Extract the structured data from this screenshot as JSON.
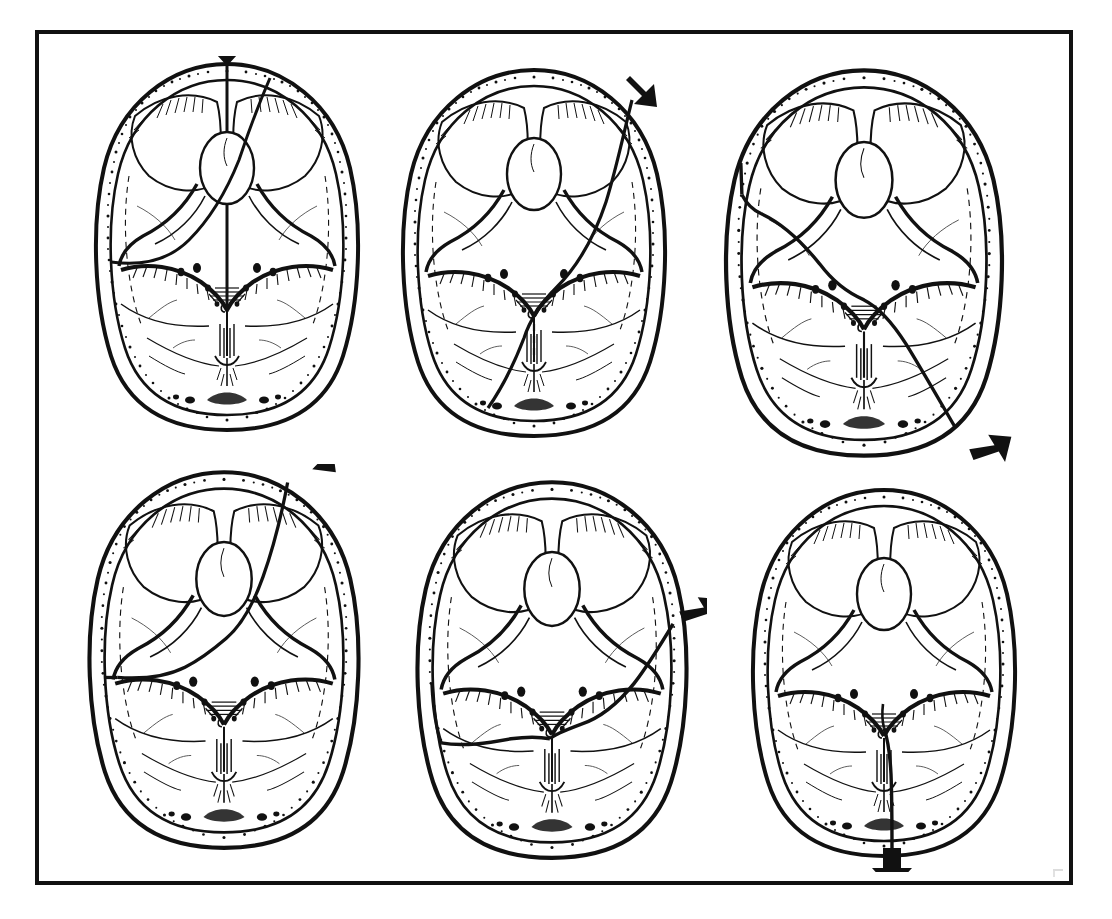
{
  "figure": {
    "domain": "anatomical-line-illustration",
    "frame": {
      "border_color": "#111111",
      "border_width_px": 4,
      "background": "#ffffff",
      "x": 35,
      "y": 30,
      "width": 1038,
      "height": 855
    },
    "ink_color": "#111111",
    "paper_color": "#ffffff",
    "layout": {
      "rows": 2,
      "columns": 3,
      "panel_count": 6
    },
    "view": "superior view of the internal skull base (cranial fossae)",
    "common_structures": [
      "outer table of calvarium",
      "inner table of calvarium",
      "diploe (speckled cancellous bone band)",
      "anterior cranial fossa",
      "cribriform plate",
      "crista galli",
      "lesser wing of sphenoid",
      "greater wing of sphenoid",
      "sella turcica",
      "petrous ridge of temporal bone",
      "middle cranial fossa",
      "posterior cranial fossa",
      "foramen magnum",
      "clivus",
      "internal occipital crest"
    ],
    "panels": [
      {
        "id": "panel-1",
        "label": "A",
        "position": "row 1, column 1",
        "impact_arrows": [
          {
            "name": "arrow-vertex-midline",
            "direction": "down",
            "target": "frontal midline / metopic region",
            "style": "solid block arrow"
          },
          {
            "name": "arrow-right-frontal-oblique",
            "direction": "down-left",
            "target": "right frontal paramedian vault",
            "style": "solid block arrow"
          }
        ],
        "arrow_count": 2,
        "fracture_description": "Midline sagittal fracture running from the frontal vertex posteriorly through the cribriform plate and along the midline to the clivus, with a second oblique limb sweeping from the right frontal region down toward the left petrous/middle fossa."
      },
      {
        "id": "panel-2",
        "label": "B",
        "position": "row 1, column 2",
        "impact_arrows": [
          {
            "name": "arrow-right-frontoparietal",
            "direction": "down-left",
            "target": "right frontoparietal vault",
            "style": "solid block arrow"
          }
        ],
        "arrow_count": 1,
        "fracture_description": "Single long oblique fracture entering at the right frontoparietal vault, crossing the floor of the middle fossa near the sella, and exiting through the left posterior fossa toward the occiput."
      },
      {
        "id": "panel-3",
        "label": "C",
        "position": "row 1, column 3",
        "impact_arrows": [
          {
            "name": "arrow-left-occipital",
            "direction": "up-left",
            "target": "left occipital / asterion region",
            "style": "solid block arrow"
          }
        ],
        "arrow_count": 1,
        "fracture_description": "Fracture beginning at the right occipital region, running forward across the posterior fossa floor and petrous apex into the middle fossa, then laterally into the left temporal vault."
      },
      {
        "id": "panel-4",
        "label": "D",
        "position": "row 2, column 1",
        "impact_arrows": [
          {
            "name": "arrow-right-frontal-vault",
            "direction": "down-left",
            "target": "right frontal vault near coronal suture",
            "style": "solid block arrow"
          }
        ],
        "arrow_count": 1,
        "fracture_description": "Fracture from the right frontal vault running medially and posteriorly across the anterior fossa and lesser sphenoid wing, continuing to the left petrous ridge and out to the left lateral vault."
      },
      {
        "id": "panel-5",
        "label": "E",
        "position": "row 2, column 2",
        "impact_arrows": [
          {
            "name": "arrow-right-temporal",
            "direction": "left",
            "target": "right temporal squama (lateral blow)",
            "style": "solid block arrow"
          }
        ],
        "arrow_count": 1,
        "fracture_description": "Transverse fracture from a lateral temporal blow crossing the middle fossa floor, the sella and both petrous ridges, and exiting at the contralateral left temporal vault."
      },
      {
        "id": "panel-6",
        "label": "F",
        "position": "row 2, column 3",
        "impact_arrows": [
          {
            "name": "arrow-occipital-midline",
            "direction": "up",
            "target": "occipital midline / inion",
            "style": "solid block arrow"
          }
        ],
        "arrow_count": 1,
        "fracture_description": "Midline posterior fracture from the occipital squama running forward through the internal occipital crest and clivus to the region of the foramen magnum and sella."
      }
    ],
    "arrow_style": {
      "fill": "#111111",
      "type": "solid-block-arrow"
    },
    "corner_mark": {
      "present": true,
      "description": "faint plate-number smudge at lower right inside the frame"
    }
  }
}
